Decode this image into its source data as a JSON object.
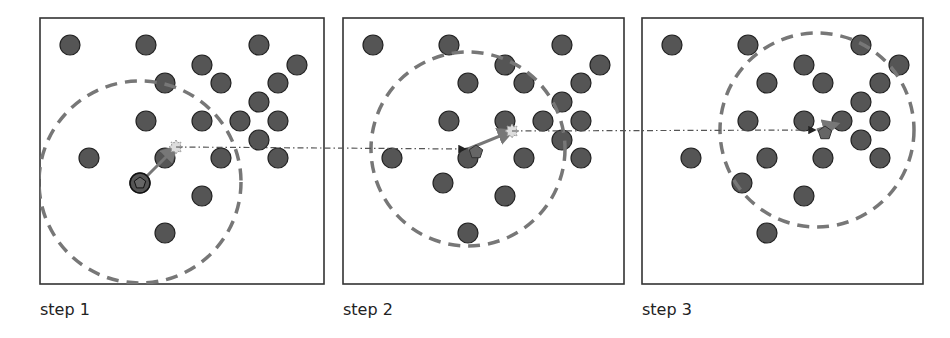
{
  "colors": {
    "dot_fill": "#555555",
    "dot_stroke": "#222222",
    "panel_border": "#333333",
    "window_circle": "#777777",
    "shift_arrow": "#777777",
    "trace_line": "#555555",
    "mean_marker": "#dddddd"
  },
  "points": [
    [
      30,
      27
    ],
    [
      106,
      27
    ],
    [
      219,
      27
    ],
    [
      162,
      47
    ],
    [
      257,
      47
    ],
    [
      125,
      65
    ],
    [
      181,
      65
    ],
    [
      238,
      65
    ],
    [
      219,
      84
    ],
    [
      106,
      103
    ],
    [
      162,
      103
    ],
    [
      200,
      103
    ],
    [
      238,
      103
    ],
    [
      219,
      122
    ],
    [
      49,
      140
    ],
    [
      125,
      140
    ],
    [
      181,
      140
    ],
    [
      238,
      140
    ],
    [
      100,
      165
    ],
    [
      162,
      178
    ],
    [
      125,
      215
    ]
  ],
  "panels": [
    {
      "label": "step 1",
      "x": 40,
      "y": 18,
      "w": 284,
      "h": 266,
      "circle": {
        "cx": 100,
        "cy": 164,
        "r": 101
      },
      "start": [
        100,
        165
      ],
      "mean": [
        136,
        129
      ]
    },
    {
      "label": "step 2",
      "x": 343,
      "y": 18,
      "w": 281,
      "h": 266,
      "circle": {
        "cx": 125,
        "cy": 131,
        "r": 97
      },
      "start": [
        125,
        131
      ],
      "mean": [
        169,
        113
      ]
    },
    {
      "label": "step 3",
      "x": 642,
      "y": 18,
      "w": 281,
      "h": 266,
      "circle": {
        "cx": 175,
        "cy": 112,
        "r": 97
      },
      "start": [
        175,
        112
      ],
      "mean": [
        195,
        106
      ]
    }
  ],
  "traces": [
    {
      "from": [
        176,
        147
      ],
      "to": [
        465,
        149
      ]
    },
    {
      "from": [
        512,
        131
      ],
      "to": [
        815,
        130
      ]
    }
  ]
}
